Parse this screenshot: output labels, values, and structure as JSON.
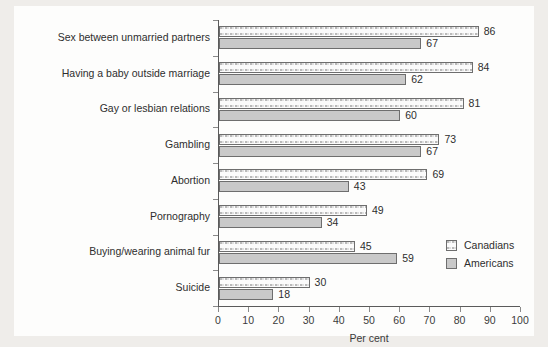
{
  "chart_data": {
    "type": "bar",
    "orientation": "horizontal",
    "title": "",
    "xlabel": "Per cent",
    "ylabel": "",
    "xlim": [
      0,
      100
    ],
    "xticks": [
      0,
      10,
      20,
      30,
      40,
      50,
      60,
      70,
      80,
      90,
      100
    ],
    "xticklabels": [
      "0",
      "10",
      "20",
      "30",
      "40",
      "50",
      "60",
      "70",
      "80",
      "90",
      "100"
    ],
    "grid": false,
    "legend_position": "right-inside",
    "categories": [
      "Sex between unmarried partners",
      "Having a baby outside marriage",
      "Gay or lesbian relations",
      "Gambling",
      "Abortion",
      "Pornography",
      "Buying/wearing animal fur",
      "Suicide"
    ],
    "series": [
      {
        "name": "Canadians",
        "pattern": "stippled",
        "values": [
          86,
          84,
          81,
          73,
          69,
          49,
          45,
          30
        ]
      },
      {
        "name": "Americans",
        "pattern": "solid-gray",
        "values": [
          67,
          62,
          60,
          67,
          43,
          34,
          59,
          18
        ]
      }
    ]
  },
  "legend": {
    "items": [
      {
        "label": "Canadians",
        "swatch": "stippled-swatch"
      },
      {
        "label": "Americans",
        "swatch": "solid-gray-swatch"
      }
    ]
  },
  "axis": {
    "x_title": "Per cent"
  },
  "colors": {
    "page_background": "#efedea",
    "chart_background": "#fdfdfc",
    "bar_outline": "#6e6e6e",
    "americans_fill": "#c9c9c9",
    "canadians_fill": "#fbfbfb",
    "axis_line": "#5b5b5b",
    "text": "#2e2e2e"
  }
}
